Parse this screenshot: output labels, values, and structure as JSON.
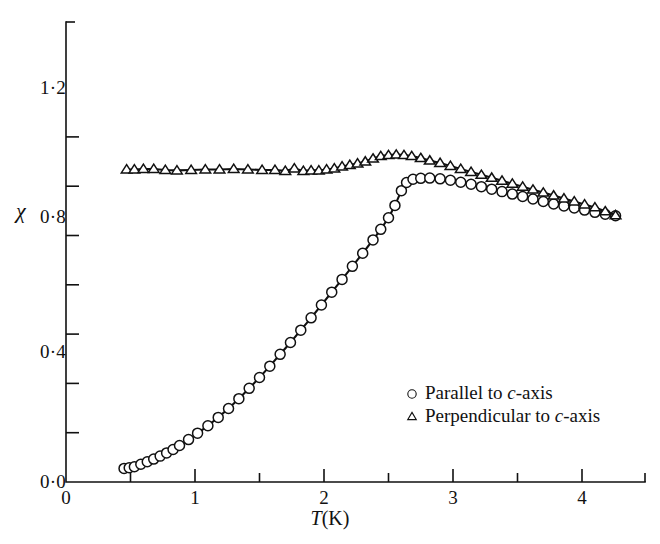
{
  "figure": {
    "background_color": "#ffffff",
    "ink_color": "#111111",
    "width": 660,
    "height": 544
  },
  "axes": {
    "y_title": "χ",
    "x_title_symbol": "T",
    "x_title_unit": "(K)",
    "x_ticks_major": [
      "0",
      "1",
      "2",
      "3",
      "4"
    ],
    "y_ticks_major": [
      "0·0",
      "0·4",
      "0·8",
      "1·2"
    ]
  },
  "legend": {
    "position": "inside-lower-right",
    "entries": [
      {
        "marker": "circle-open",
        "marker_icon": "circle-marker-icon",
        "text_before": "Parallel to ",
        "text_italic": "c",
        "text_after": "-axis"
      },
      {
        "marker": "triangle-open",
        "marker_icon": "triangle-marker-icon",
        "text_before": "Perpendicular to ",
        "text_italic": "c",
        "text_after": "-axis"
      }
    ]
  },
  "chart_data": {
    "type": "scatter",
    "title": "",
    "xlabel": "T (K)",
    "ylabel": "χ",
    "xlim": [
      0,
      4.5
    ],
    "ylim": [
      0.0,
      1.42
    ],
    "grid": false,
    "x_major_ticks": [
      0,
      1,
      2,
      3,
      4
    ],
    "x_minor_ticks": [
      0.5,
      1.5,
      2.5,
      3.5,
      4.5
    ],
    "y_major_ticks": [
      0.0,
      0.4,
      0.8,
      1.2
    ],
    "y_minor_ticks": [
      0.2,
      0.6,
      1.0,
      1.4
    ],
    "legend_position": "inside lower-right",
    "series": [
      {
        "name": "Parallel to c-axis",
        "marker": "circle-open",
        "line": "solid",
        "points": [
          [
            0.45,
            0.055
          ],
          [
            0.49,
            0.058
          ],
          [
            0.53,
            0.062
          ],
          [
            0.58,
            0.072
          ],
          [
            0.63,
            0.082
          ],
          [
            0.68,
            0.093
          ],
          [
            0.73,
            0.105
          ],
          [
            0.78,
            0.118
          ],
          [
            0.83,
            0.132
          ],
          [
            0.88,
            0.148
          ],
          [
            0.95,
            0.172
          ],
          [
            1.02,
            0.198
          ],
          [
            1.1,
            0.228
          ],
          [
            1.18,
            0.262
          ],
          [
            1.26,
            0.298
          ],
          [
            1.34,
            0.338
          ],
          [
            1.42,
            0.38
          ],
          [
            1.5,
            0.424
          ],
          [
            1.58,
            0.47
          ],
          [
            1.66,
            0.518
          ],
          [
            1.74,
            0.566
          ],
          [
            1.82,
            0.616
          ],
          [
            1.9,
            0.666
          ],
          [
            1.98,
            0.718
          ],
          [
            2.06,
            0.77
          ],
          [
            2.14,
            0.822
          ],
          [
            2.22,
            0.875
          ],
          [
            2.3,
            0.928
          ],
          [
            2.38,
            0.982
          ],
          [
            2.44,
            1.025
          ],
          [
            2.5,
            1.072
          ],
          [
            2.55,
            1.122
          ],
          [
            2.6,
            1.182
          ],
          [
            2.64,
            1.215
          ],
          [
            2.69,
            1.228
          ],
          [
            2.75,
            1.232
          ],
          [
            2.82,
            1.233
          ],
          [
            2.9,
            1.23
          ],
          [
            2.98,
            1.224
          ],
          [
            3.06,
            1.216
          ],
          [
            3.14,
            1.208
          ],
          [
            3.22,
            1.198
          ],
          [
            3.3,
            1.188
          ],
          [
            3.38,
            1.178
          ],
          [
            3.46,
            1.168
          ],
          [
            3.54,
            1.158
          ],
          [
            3.62,
            1.148
          ],
          [
            3.7,
            1.138
          ],
          [
            3.78,
            1.128
          ],
          [
            3.86,
            1.12
          ],
          [
            3.94,
            1.112
          ],
          [
            4.02,
            1.103
          ],
          [
            4.1,
            1.094
          ],
          [
            4.18,
            1.086
          ],
          [
            4.26,
            1.08
          ]
        ]
      },
      {
        "name": "Perpendicular to c-axis",
        "marker": "triangle-open",
        "line": "solid",
        "points": [
          [
            0.47,
            1.268
          ],
          [
            0.53,
            1.268
          ],
          [
            0.6,
            1.27
          ],
          [
            0.68,
            1.27
          ],
          [
            0.77,
            1.266
          ],
          [
            0.86,
            1.264
          ],
          [
            0.97,
            1.266
          ],
          [
            1.08,
            1.268
          ],
          [
            1.19,
            1.268
          ],
          [
            1.3,
            1.27
          ],
          [
            1.41,
            1.268
          ],
          [
            1.52,
            1.266
          ],
          [
            1.62,
            1.266
          ],
          [
            1.7,
            1.262
          ],
          [
            1.77,
            1.272
          ],
          [
            1.84,
            1.262
          ],
          [
            1.9,
            1.264
          ],
          [
            1.96,
            1.264
          ],
          [
            2.02,
            1.268
          ],
          [
            2.08,
            1.272
          ],
          [
            2.14,
            1.28
          ],
          [
            2.2,
            1.286
          ],
          [
            2.26,
            1.292
          ],
          [
            2.32,
            1.3
          ],
          [
            2.38,
            1.312
          ],
          [
            2.44,
            1.322
          ],
          [
            2.5,
            1.326
          ],
          [
            2.56,
            1.328
          ],
          [
            2.62,
            1.326
          ],
          [
            2.68,
            1.322
          ],
          [
            2.75,
            1.314
          ],
          [
            2.82,
            1.304
          ],
          [
            2.9,
            1.294
          ],
          [
            2.98,
            1.282
          ],
          [
            3.06,
            1.27
          ],
          [
            3.14,
            1.258
          ],
          [
            3.22,
            1.246
          ],
          [
            3.3,
            1.234
          ],
          [
            3.38,
            1.222
          ],
          [
            3.46,
            1.21
          ],
          [
            3.54,
            1.198
          ],
          [
            3.62,
            1.186
          ],
          [
            3.7,
            1.174
          ],
          [
            3.78,
            1.162
          ],
          [
            3.86,
            1.15
          ],
          [
            3.94,
            1.138
          ],
          [
            4.02,
            1.126
          ],
          [
            4.1,
            1.114
          ],
          [
            4.18,
            1.098
          ],
          [
            4.26,
            1.082
          ]
        ]
      }
    ]
  }
}
